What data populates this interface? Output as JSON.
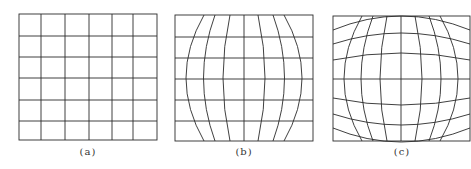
{
  "figure": {
    "panels": [
      {
        "id": "a",
        "caption": "(a)",
        "description": "undistorted square grid, 6x6 cells",
        "cols": 6,
        "rows": 6
      },
      {
        "id": "b",
        "caption": "(b)",
        "description": "grid with vertical lines bowed outward (horizontal barrel distortion), horizontal lines straight",
        "cols": 6,
        "rows": 6
      },
      {
        "id": "c",
        "caption": "(c)",
        "description": "grid with both vertical and horizontal lines bowed outward (barrel distortion)",
        "cols": 6,
        "rows": 6
      }
    ],
    "line_color": "#2a2a2a",
    "background": "#ffffff"
  }
}
